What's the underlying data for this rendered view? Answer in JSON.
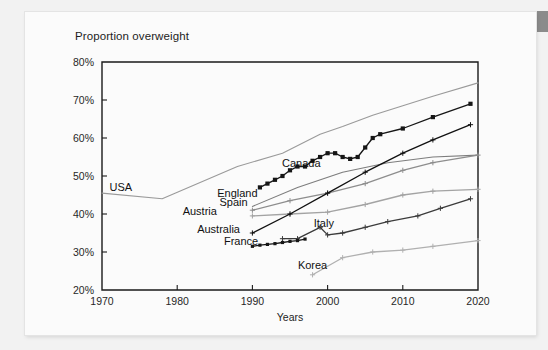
{
  "page": {
    "background_color": "#f2f2f2",
    "sheet_color": "#fbfbfb",
    "corner_tab_color": "#8b8b8b"
  },
  "chart_data": {
    "type": "line",
    "title": "Proportion overweight",
    "xlabel": "Years",
    "ylabel": "",
    "xlim": [
      1970,
      2020
    ],
    "ylim": [
      20,
      80
    ],
    "xticks": [
      "1970",
      "1980",
      "1990",
      "2000",
      "2010",
      "2020"
    ],
    "yticks": [
      "20%",
      "30%",
      "40%",
      "50%",
      "60%",
      "70%",
      "80%"
    ],
    "grid": false,
    "legend": "inline-labels",
    "series": [
      {
        "name": "USA",
        "color": "#9a9a9a",
        "marker": "none",
        "label_x": 1972.5,
        "label_y": 46.0,
        "x": [
          1970,
          1978,
          1988,
          1994,
          1999,
          2002,
          2006,
          2010,
          2014,
          2020
        ],
        "values": [
          45.5,
          44.0,
          52.5,
          56.0,
          61.0,
          63.0,
          66.0,
          68.5,
          71.0,
          74.5
        ]
      },
      {
        "name": "England",
        "color": "#161616",
        "marker": "square",
        "label_x": 1988.0,
        "label_y": 44.5,
        "x": [
          1991,
          1992,
          1993,
          1994,
          1995,
          1996,
          1997,
          1998,
          1999,
          2000,
          2001,
          2002,
          2003,
          2004,
          2005,
          2006,
          2007,
          2010,
          2014,
          2019
        ],
        "values": [
          47.0,
          48.0,
          49.0,
          50.0,
          51.5,
          52.5,
          52.5,
          54.0,
          55.0,
          56.0,
          56.0,
          55.0,
          54.5,
          55.0,
          57.5,
          60.0,
          61.0,
          62.5,
          65.5,
          69.0
        ]
      },
      {
        "name": "Canada",
        "color": "#7d7d7d",
        "marker": "none",
        "label_x": 1996.5,
        "label_y": 52.5,
        "x": [
          1990,
          1996,
          2002,
          2008,
          2014,
          2020
        ],
        "values": [
          42.0,
          47.0,
          51.0,
          53.5,
          55.0,
          55.5
        ]
      },
      {
        "name": "Spain",
        "color": "#8d8d8d",
        "marker": "plus",
        "label_x": 1987.5,
        "label_y": 42.2,
        "x": [
          1990,
          1995,
          2000,
          2005,
          2010,
          2014,
          2020
        ],
        "values": [
          41.0,
          43.5,
          45.5,
          48.0,
          51.5,
          53.5,
          55.5
        ]
      },
      {
        "name": "Austria",
        "color": "#a3a3a3",
        "marker": "plus",
        "label_x": 1983.0,
        "label_y": 39.8,
        "x": [
          1990,
          1995,
          2000,
          2005,
          2010,
          2014,
          2020
        ],
        "values": [
          39.5,
          40.0,
          40.5,
          42.5,
          45.0,
          46.0,
          46.5
        ]
      },
      {
        "name": "Australia",
        "color": "#111111",
        "marker": "plus",
        "label_x": 1985.5,
        "label_y": 35.0,
        "x": [
          1990,
          1995,
          2000,
          2005,
          2010,
          2014,
          2019
        ],
        "values": [
          35.0,
          40.0,
          45.5,
          51.0,
          56.0,
          59.5,
          63.5
        ]
      },
      {
        "name": "Italy",
        "color": "#3b3b3b",
        "marker": "plus",
        "label_x": 1999.5,
        "label_y": 36.5,
        "x": [
          1994,
          1996,
          1999,
          2000,
          2002,
          2005,
          2008,
          2012,
          2015,
          2019
        ],
        "values": [
          33.5,
          33.5,
          36.5,
          34.5,
          35.0,
          36.5,
          38.0,
          39.5,
          41.5,
          44.0
        ]
      },
      {
        "name": "France",
        "color": "#161616",
        "marker": "square-small",
        "label_x": 1988.5,
        "label_y": 31.8,
        "x": [
          1990,
          1991,
          1992,
          1993,
          1994,
          1995,
          1996,
          1997
        ],
        "values": [
          31.5,
          31.8,
          32.0,
          32.2,
          32.5,
          32.8,
          33.0,
          33.4
        ]
      },
      {
        "name": "Korea",
        "color": "#b0b0b0",
        "marker": "plus",
        "label_x": 1998.0,
        "label_y": 25.5,
        "x": [
          1998,
          2002,
          2006,
          2010,
          2014,
          2020
        ],
        "values": [
          24.0,
          28.5,
          30.0,
          30.5,
          31.5,
          33.0
        ]
      }
    ]
  }
}
